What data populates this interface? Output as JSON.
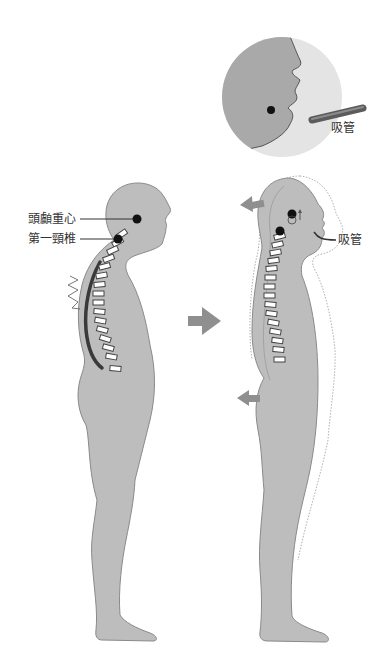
{
  "diagram": {
    "title": "",
    "left_figure": {
      "description": "slouched posture, forward head",
      "labels": {
        "head_center_of_gravity": "頭顱重心",
        "first_cervical_vertebra": "第一頸椎"
      }
    },
    "transition_arrow": "right-arrow",
    "right_figure": {
      "description": "corrected posture with straw",
      "labels": {
        "straw": "吸管"
      }
    },
    "inset": {
      "description": "close-up of mouth holding straw",
      "labels": {
        "straw": "吸管"
      }
    },
    "colors": {
      "body_fill": "#bdbdbd",
      "body_outline": "#8a8a8a",
      "inset_bg": "#e6e6e6",
      "arrow": "#8f8f8f",
      "spine_dark": "#3a3a3a",
      "dot": "#111111",
      "straw": "#6e6e6e"
    }
  }
}
